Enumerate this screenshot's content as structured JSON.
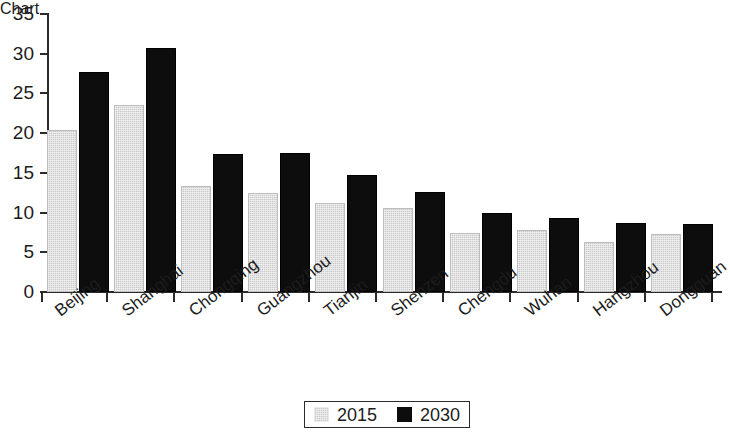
{
  "chart_data": {
    "type": "bar",
    "title": "",
    "subtitle": "",
    "xlabel": "",
    "ylabel": "",
    "ylim": [
      0,
      35
    ],
    "yticks": [
      0,
      5,
      10,
      15,
      20,
      25,
      30,
      35
    ],
    "ytick_labels": [
      "0",
      "5",
      "10",
      "15",
      "20",
      "25",
      "30",
      "35"
    ],
    "grid": false,
    "legend_position": "bottom-center",
    "categories": [
      "Beijing",
      "Shanghai",
      "Chongqing",
      "Guangzhou",
      "Tianjin",
      "Shenzen",
      "Chengdu",
      "Wuhan",
      "Hangzhou",
      "Dongguan"
    ],
    "series": [
      {
        "name": "2015",
        "color": "#c9c9c9",
        "values": [
          20.4,
          23.6,
          13.3,
          12.5,
          11.2,
          10.6,
          7.4,
          7.8,
          6.3,
          7.3
        ]
      },
      {
        "name": "2030",
        "color": "#0d0d0d",
        "values": [
          27.7,
          30.7,
          17.4,
          17.5,
          14.7,
          12.6,
          10.0,
          9.3,
          8.7,
          8.6
        ]
      }
    ],
    "legend": [
      {
        "label": "2015",
        "color": "#c9c9c9"
      },
      {
        "label": "2030",
        "color": "#0d0d0d"
      }
    ]
  },
  "axis": {
    "y_axis_color": "#2b2b2b",
    "x_axis_color": "#2b2b2b"
  }
}
